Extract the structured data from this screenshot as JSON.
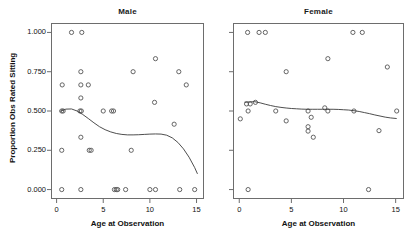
{
  "chart_data": {
    "type": "scatter",
    "title": "",
    "xlabel": "Age at Observation",
    "ylabel": "Proportion Obs Rated Sitting",
    "xlim": [
      -0.6,
      15.8
    ],
    "ylim": [
      -0.06,
      1.06
    ],
    "xticks": [
      0,
      5,
      10,
      15
    ],
    "xticklabels": [
      "0",
      "5",
      "10",
      "15"
    ],
    "yticks": [
      0.0,
      0.25,
      0.5,
      0.75,
      1.0
    ],
    "yticklabels": [
      "0.000",
      "0.250",
      "0.500",
      "0.750",
      "1.000"
    ],
    "grid": false,
    "legend": null,
    "marker": "open-circle",
    "marker_color": "#555555",
    "line_color": "#3a3a3a",
    "panels": [
      {
        "label": "Male",
        "points": [
          [
            1.6,
            1.0
          ],
          [
            2.7,
            1.0
          ],
          [
            10.6,
            0.833
          ],
          [
            2.6,
            0.75
          ],
          [
            8.2,
            0.75
          ],
          [
            13.1,
            0.75
          ],
          [
            0.6,
            0.666
          ],
          [
            2.6,
            0.666
          ],
          [
            3.4,
            0.666
          ],
          [
            13.9,
            0.666
          ],
          [
            2.6,
            0.583
          ],
          [
            10.5,
            0.555
          ],
          [
            0.55,
            0.5
          ],
          [
            0.7,
            0.5
          ],
          [
            2.5,
            0.5
          ],
          [
            2.65,
            0.5
          ],
          [
            5.0,
            0.5
          ],
          [
            5.9,
            0.5
          ],
          [
            6.1,
            0.5
          ],
          [
            12.6,
            0.416
          ],
          [
            2.6,
            0.333
          ],
          [
            0.55,
            0.25
          ],
          [
            3.5,
            0.25
          ],
          [
            3.7,
            0.25
          ],
          [
            8.0,
            0.25
          ],
          [
            0.55,
            0.0
          ],
          [
            2.6,
            0.0
          ],
          [
            6.2,
            0.0
          ],
          [
            6.4,
            0.0
          ],
          [
            6.55,
            0.0
          ],
          [
            7.4,
            0.0
          ],
          [
            10.0,
            0.0
          ],
          [
            10.6,
            0.0
          ],
          [
            13.2,
            0.0
          ],
          [
            14.8,
            0.0
          ]
        ],
        "smooth": [
          [
            0.4,
            0.498
          ],
          [
            1.0,
            0.512
          ],
          [
            1.6,
            0.513
          ],
          [
            2.2,
            0.5
          ],
          [
            2.8,
            0.478
          ],
          [
            3.4,
            0.452
          ],
          [
            4.0,
            0.425
          ],
          [
            4.6,
            0.4
          ],
          [
            5.2,
            0.381
          ],
          [
            5.8,
            0.367
          ],
          [
            6.4,
            0.357
          ],
          [
            7.0,
            0.351
          ],
          [
            7.6,
            0.348
          ],
          [
            8.2,
            0.348
          ],
          [
            8.8,
            0.349
          ],
          [
            9.4,
            0.351
          ],
          [
            10.0,
            0.353
          ],
          [
            10.6,
            0.354
          ],
          [
            11.2,
            0.353
          ],
          [
            11.8,
            0.346
          ],
          [
            12.4,
            0.329
          ],
          [
            13.0,
            0.3
          ],
          [
            13.6,
            0.259
          ],
          [
            14.2,
            0.206
          ],
          [
            14.8,
            0.14
          ],
          [
            15.1,
            0.1
          ]
        ]
      },
      {
        "label": "Female",
        "points": [
          [
            0.8,
            1.0
          ],
          [
            1.9,
            1.0
          ],
          [
            2.5,
            1.0
          ],
          [
            10.9,
            1.0
          ],
          [
            11.8,
            1.0
          ],
          [
            8.5,
            0.833
          ],
          [
            14.2,
            0.78
          ],
          [
            4.5,
            0.75
          ],
          [
            0.7,
            0.545
          ],
          [
            1.05,
            0.545
          ],
          [
            1.55,
            0.555
          ],
          [
            8.2,
            0.52
          ],
          [
            0.85,
            0.5
          ],
          [
            3.5,
            0.5
          ],
          [
            6.6,
            0.5
          ],
          [
            8.5,
            0.5
          ],
          [
            11.0,
            0.5
          ],
          [
            15.1,
            0.5
          ],
          [
            0.1,
            0.45
          ],
          [
            4.5,
            0.437
          ],
          [
            6.9,
            0.46
          ],
          [
            6.6,
            0.4
          ],
          [
            6.6,
            0.372
          ],
          [
            13.4,
            0.375
          ],
          [
            7.1,
            0.333
          ],
          [
            0.85,
            0.0
          ],
          [
            12.4,
            0.0
          ]
        ],
        "smooth": [
          [
            0.5,
            0.556
          ],
          [
            1.0,
            0.558
          ],
          [
            1.5,
            0.559
          ],
          [
            2.0,
            0.552
          ],
          [
            2.5,
            0.543
          ],
          [
            3.0,
            0.535
          ],
          [
            3.5,
            0.528
          ],
          [
            4.0,
            0.523
          ],
          [
            4.5,
            0.519
          ],
          [
            5.0,
            0.516
          ],
          [
            5.5,
            0.514
          ],
          [
            6.0,
            0.512
          ],
          [
            6.5,
            0.511
          ],
          [
            7.0,
            0.511
          ],
          [
            7.5,
            0.511
          ],
          [
            8.0,
            0.511
          ],
          [
            8.5,
            0.511
          ],
          [
            9.0,
            0.511
          ],
          [
            9.5,
            0.51
          ],
          [
            10.0,
            0.508
          ],
          [
            10.5,
            0.506
          ],
          [
            11.0,
            0.502
          ],
          [
            11.5,
            0.497
          ],
          [
            12.0,
            0.49
          ],
          [
            12.5,
            0.483
          ],
          [
            13.0,
            0.475
          ],
          [
            13.5,
            0.468
          ],
          [
            14.0,
            0.461
          ],
          [
            14.5,
            0.456
          ],
          [
            15.1,
            0.452
          ]
        ]
      }
    ]
  }
}
